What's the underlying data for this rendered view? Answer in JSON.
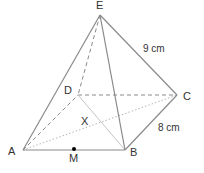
{
  "figure": {
    "type": "square-pyramid",
    "colors": {
      "edge": "#8a8a8a",
      "hidden_edge": "#8a8a8a",
      "diagonal": "#b5b5b5",
      "text": "#333333",
      "point": "#000000"
    },
    "vertices": {
      "E": {
        "label": "E",
        "x": 100,
        "y": 15
      },
      "D": {
        "label": "D",
        "x": 78,
        "y": 95
      },
      "C": {
        "label": "C",
        "x": 177,
        "y": 95
      },
      "A": {
        "label": "A",
        "x": 23,
        "y": 150
      },
      "B": {
        "label": "B",
        "x": 125,
        "y": 150
      }
    },
    "points": {
      "M": {
        "label": "M",
        "x": 74,
        "y": 150
      },
      "X": {
        "label": "X"
      }
    },
    "measurements": {
      "EC": "9 cm",
      "BC": "8 cm"
    }
  }
}
